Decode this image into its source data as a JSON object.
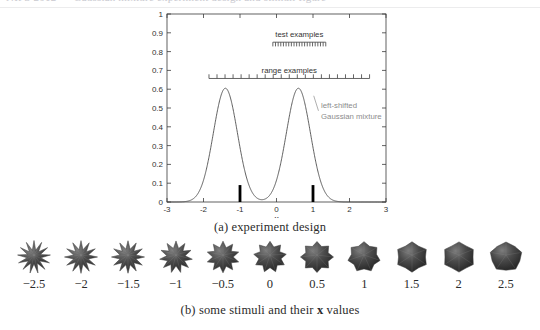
{
  "page": {
    "top_cropped_text": "NIPS 2012 — Gaussian mixture experiment design and stimuli figure"
  },
  "figure": {
    "caption_a": "(a) experiment design",
    "caption_b_pre": "(b) some stimuli and their ",
    "caption_b_bold": "x",
    "caption_b_post": " values"
  },
  "chart_data": {
    "type": "line",
    "title": "",
    "xlabel": "x",
    "ylabel": "",
    "xlim": [
      -3,
      3
    ],
    "ylim": [
      0,
      1
    ],
    "grid": false,
    "x_ticks": [
      -3,
      -2,
      -1,
      0,
      1,
      2,
      3
    ],
    "x_tick_labels": [
      "-3",
      "-2",
      "-1",
      "0",
      "1",
      "2",
      "3"
    ],
    "y_ticks": [
      0,
      0.1,
      0.2,
      0.3,
      0.4,
      0.5,
      0.6,
      0.7,
      0.8,
      0.9,
      1
    ],
    "y_tick_labels": [
      "0",
      "0.1",
      "0.2",
      "0.3",
      "0.4",
      "0.5",
      "0.6",
      "0.7",
      "0.8",
      "0.9",
      "1"
    ],
    "series": [
      {
        "name": "left-shifted Gaussian mixture",
        "type": "line",
        "color": "#4d4d4d",
        "mixture": [
          {
            "mean": -1.4,
            "sigma": 0.33,
            "weight": 0.5
          },
          {
            "mean": 0.6,
            "sigma": 0.33,
            "weight": 0.5
          }
        ],
        "peak_value": 0.605,
        "annotation_line1": "left-shifted",
        "annotation_line2": "Gaussian mixture",
        "annotation_color": "#8c8c8c"
      },
      {
        "name": "training examples",
        "type": "bar",
        "color": "#000000",
        "x": [
          -1,
          1
        ],
        "values": [
          0.09,
          0.09
        ]
      }
    ],
    "example_rows": [
      {
        "id": "test-examples",
        "label": "test examples",
        "y": 0.85,
        "x_start": -0.1,
        "x_end": 1.35,
        "n_ticks": 21,
        "tick_direction": "down",
        "color": "#555555"
      },
      {
        "id": "range-examples",
        "label": "range examples",
        "y": 0.657,
        "x_start": -1.85,
        "x_end": 2.55,
        "n_ticks": 21,
        "tick_direction": "up",
        "color": "#555555"
      }
    ]
  },
  "stimuli": {
    "items": [
      {
        "label": "−2.5",
        "x": -2.5,
        "spikes": 13,
        "spikiness": 1.0
      },
      {
        "label": "−2",
        "x": -2.0,
        "spikes": 12,
        "spikiness": 0.92
      },
      {
        "label": "−1.5",
        "x": -1.5,
        "spikes": 12,
        "spikiness": 0.84
      },
      {
        "label": "−1",
        "x": -1.0,
        "spikes": 11,
        "spikiness": 0.72
      },
      {
        "label": "−0.5",
        "x": -0.5,
        "spikes": 10,
        "spikiness": 0.6
      },
      {
        "label": "0",
        "x": 0.0,
        "spikes": 9,
        "spikiness": 0.48
      },
      {
        "label": "0.5",
        "x": 0.5,
        "spikes": 8,
        "spikiness": 0.38
      },
      {
        "label": "1",
        "x": 1.0,
        "spikes": 7,
        "spikiness": 0.29
      },
      {
        "label": "1.5",
        "x": 1.5,
        "spikes": 6,
        "spikiness": 0.21
      },
      {
        "label": "2",
        "x": 2.0,
        "spikes": 6,
        "spikiness": 0.14
      },
      {
        "label": "2.5",
        "x": 2.5,
        "spikes": 5,
        "spikiness": 0.08
      }
    ]
  }
}
